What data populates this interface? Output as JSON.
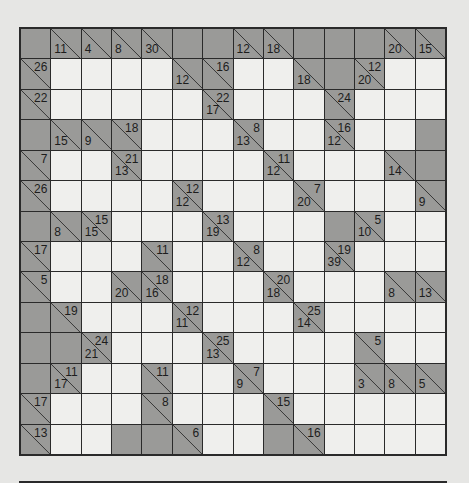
{
  "puzzle": {
    "type": "Kakuro",
    "rows": 14,
    "cols": 14,
    "colors": {
      "white_cell": "#efefed",
      "clue_cell": "#9a9a98",
      "grid_line": "#2a2a2a",
      "background": "#e6e6e4"
    },
    "grid": [
      [
        "B",
        {
          "d": "11"
        },
        {
          "d": "4"
        },
        {
          "d": "8"
        },
        {
          "d": "30"
        },
        "B",
        "B",
        {
          "d": "12"
        },
        {
          "d": "18"
        },
        "B",
        "B",
        "B",
        {
          "d": "20"
        },
        {
          "d": "15"
        }
      ],
      [
        {
          "a": "26"
        },
        "W",
        "W",
        "W",
        "W",
        {
          "d": "12"
        },
        {
          "a": "16"
        },
        "W",
        "W",
        {
          "d": "18"
        },
        "B",
        {
          "a": "12",
          "d": "20"
        },
        "W",
        "W"
      ],
      [
        {
          "a": "22"
        },
        "W",
        "W",
        "W",
        "W",
        "W",
        {
          "a": "22",
          "d": "17"
        },
        "W",
        "W",
        "W",
        {
          "a": "24"
        },
        "W",
        "W",
        "W"
      ],
      [
        "B",
        {
          "d": "15"
        },
        {
          "d": "9"
        },
        {
          "a": "18"
        },
        "W",
        "W",
        "W",
        {
          "a": "8",
          "d": "13"
        },
        "W",
        "W",
        {
          "a": "16",
          "d": "12"
        },
        "W",
        "W",
        "B"
      ],
      [
        {
          "a": "7"
        },
        "W",
        "W",
        {
          "a": "21",
          "d": "13"
        },
        "W",
        "W",
        "W",
        "W",
        {
          "a": "11",
          "d": "12"
        },
        "W",
        "W",
        "W",
        {
          "d": "14"
        },
        "B"
      ],
      [
        {
          "a": "26"
        },
        "W",
        "W",
        "W",
        "W",
        {
          "a": "12",
          "d": "12"
        },
        "W",
        "W",
        "W",
        {
          "a": "7",
          "d": "20"
        },
        "W",
        "W",
        "W",
        {
          "d": "9"
        }
      ],
      [
        "B",
        {
          "d": "8"
        },
        {
          "a": "15",
          "d": "15"
        },
        "W",
        "W",
        "W",
        {
          "a": "13",
          "d": "19"
        },
        "W",
        "W",
        "W",
        "B",
        {
          "a": "5",
          "d": "10"
        },
        "W",
        "W"
      ],
      [
        {
          "a": "17"
        },
        "W",
        "W",
        "W",
        {
          "a": "11"
        },
        "W",
        "W",
        {
          "a": "8",
          "d": "12"
        },
        "W",
        "W",
        {
          "a": "19",
          "d": "39"
        },
        "W",
        "W",
        "W"
      ],
      [
        {
          "a": "5"
        },
        "W",
        "W",
        {
          "d": "20"
        },
        {
          "a": "18",
          "d": "16"
        },
        "W",
        "W",
        "W",
        {
          "a": "20",
          "d": "18"
        },
        "W",
        "W",
        "W",
        {
          "d": "8"
        },
        {
          "d": "13"
        }
      ],
      [
        "B",
        {
          "a": "19"
        },
        "W",
        "W",
        "W",
        {
          "a": "12",
          "d": "11"
        },
        "W",
        "W",
        "W",
        {
          "a": "25",
          "d": "14"
        },
        "W",
        "W",
        "W",
        "W"
      ],
      [
        "B",
        "B",
        {
          "a": "24",
          "d": "21"
        },
        "W",
        "W",
        "W",
        {
          "a": "25",
          "d": "13"
        },
        "W",
        "W",
        "W",
        "W",
        {
          "a": "5"
        },
        "W",
        "W"
      ],
      [
        "B",
        {
          "a": "11",
          "d": "17"
        },
        "W",
        "W",
        {
          "a": "11"
        },
        "W",
        "W",
        {
          "a": "7",
          "d": "9"
        },
        "W",
        "W",
        "W",
        {
          "d": "3"
        },
        {
          "d": "8"
        },
        {
          "d": "5"
        }
      ],
      [
        {
          "a": "17"
        },
        "W",
        "W",
        "W",
        {
          "a": "8"
        },
        "W",
        "W",
        "W",
        {
          "a": "15"
        },
        "W",
        "W",
        "W",
        "W",
        "W"
      ],
      [
        {
          "a": "13"
        },
        "W",
        "W",
        "B",
        "B",
        {
          "a": "6"
        },
        "W",
        "W",
        "B",
        {
          "a": "16"
        },
        "W",
        "W",
        "W",
        "W"
      ]
    ]
  }
}
